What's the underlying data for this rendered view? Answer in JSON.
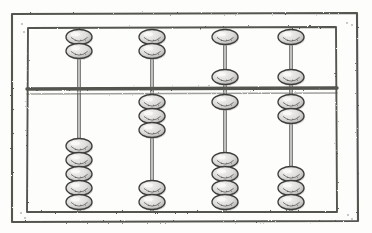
{
  "figure": {
    "medium": "pencil drawing",
    "background_color": "#fdfdfc",
    "line_color": "#4a4a48",
    "bead_fill": "#dedddb",
    "bead_outline": "#3c3c3a",
    "bead_shadow": "#a9a7a4",
    "rod_color": "#5a5a58"
  },
  "frame": {
    "outer": {
      "x": 11,
      "y": 13,
      "width": 347,
      "height": 209
    },
    "inner": {
      "x": 27,
      "y": 27,
      "width": 310,
      "height": 185
    },
    "separator_bar": {
      "x": 27,
      "y": 88,
      "width": 310,
      "height": 6
    },
    "corner_marks": [
      "top-left",
      "top-right",
      "bottom-left",
      "bottom-right"
    ]
  },
  "abacus": {
    "rod_count": 4,
    "upper_deck_beads_per_rod": 2,
    "lower_deck_beads_per_rod": 5,
    "bead_width": 26,
    "bead_height": 15,
    "rod_x_positions": [
      79,
      152,
      225,
      291
    ],
    "upper_deck": {
      "top": 27,
      "bottom": 88
    },
    "lower_deck": {
      "top": 94,
      "bottom": 212
    },
    "columns": [
      {
        "index": 1,
        "name": "rod-1",
        "rod_x": 79,
        "upper_beads_top": 2,
        "upper_beads_bottom": 0,
        "lower_beads_top": 0,
        "lower_beads_bottom": 5,
        "upper_bead_y": [
          37,
          51
        ],
        "lower_bead_y": [
          146,
          160,
          174,
          188,
          202
        ]
      },
      {
        "index": 2,
        "name": "rod-2",
        "rod_x": 152,
        "upper_beads_top": 2,
        "upper_beads_bottom": 0,
        "lower_beads_top": 3,
        "lower_beads_bottom": 2,
        "upper_bead_y": [
          37,
          51
        ],
        "lower_bead_y": [
          102,
          116,
          130,
          188,
          202
        ]
      },
      {
        "index": 3,
        "name": "rod-3",
        "rod_x": 225,
        "upper_beads_top": 1,
        "upper_beads_bottom": 1,
        "lower_beads_top": 1,
        "lower_beads_bottom": 4,
        "upper_bead_y": [
          37,
          77
        ],
        "lower_bead_y": [
          102,
          160,
          174,
          188,
          202
        ]
      },
      {
        "index": 4,
        "name": "rod-4",
        "rod_x": 291,
        "upper_beads_top": 1,
        "upper_beads_bottom": 1,
        "lower_beads_top": 2,
        "lower_beads_bottom": 3,
        "upper_bead_y": [
          37,
          77
        ],
        "lower_bead_y": [
          102,
          116,
          174,
          188,
          202
        ]
      }
    ]
  }
}
